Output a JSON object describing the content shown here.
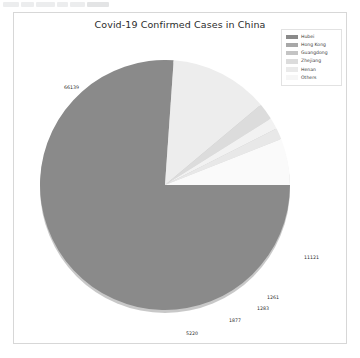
{
  "chart_data": {
    "type": "pie",
    "title": "Covid-19 Confirmed Cases in China",
    "xlabel": "",
    "ylabel": "",
    "legend_position": "top-right",
    "grid": false,
    "categories": [
      "Hubei",
      "Hong Kong",
      "Guangdong",
      "Zhejiang",
      "Henan",
      "Others"
    ],
    "values": [
      66139,
      11121,
      1877,
      1283,
      1261,
      5220
    ],
    "labels_shown": [
      "66139",
      "11121",
      "1877",
      "1283",
      "1261",
      "5220"
    ],
    "colors": [
      "#8a8a8a",
      "#d8d8d8",
      "#c9c9c9",
      "#efefef",
      "#e4e4e4",
      "#f7f7f7"
    ],
    "slices": [
      {
        "name": "Hubei",
        "value": 66139,
        "label": "66139",
        "color": "#8a8a8a"
      },
      {
        "name": "Hong Kong",
        "value": 11121,
        "label": "11121",
        "color": "#ededed"
      },
      {
        "name": "Guangdong",
        "value": 1877,
        "label": "1877",
        "color": "#dcdcdc"
      },
      {
        "name": "Zhejiang",
        "value": 1283,
        "label": "1283",
        "color": "#f2f2f2"
      },
      {
        "name": "Henan",
        "value": 1261,
        "label": "1261",
        "color": "#e8e8e8"
      },
      {
        "name": "Others",
        "value": 5220,
        "label": "5220",
        "color": "#fafafa"
      }
    ]
  },
  "chart": {
    "title": "Covid-19 Confirmed Cases in China"
  },
  "legend": {
    "items": [
      {
        "label": "Hubei",
        "color": "#8a8a8a"
      },
      {
        "label": "Hong Kong",
        "color": "#a8a8a8"
      },
      {
        "label": "Guangdong",
        "color": "#c4c4c4"
      },
      {
        "label": "Zhejiang",
        "color": "#dcdcdc"
      },
      {
        "label": "Henan",
        "color": "#eaeaea"
      },
      {
        "label": "Others",
        "color": "#f6f6f6"
      }
    ]
  },
  "data_labels": {
    "hubei": "66139",
    "hong_kong": "11121",
    "guangdong": "1261",
    "zhejiang": "1283",
    "henan": "1877",
    "others": "5220"
  }
}
